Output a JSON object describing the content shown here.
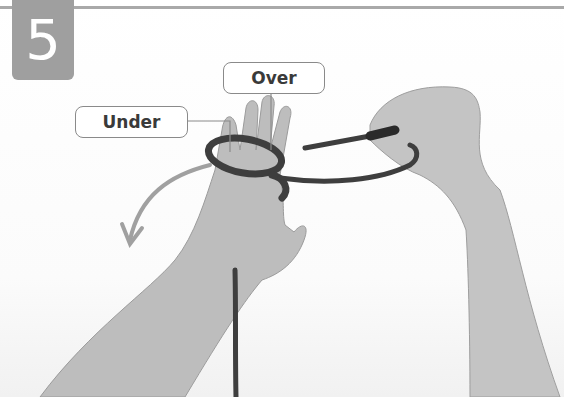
{
  "step": {
    "number": "5"
  },
  "callouts": {
    "over": "Over",
    "under": "Under"
  },
  "illustration": {
    "subject": "hands tying a knot with rope around fingers",
    "arrow_direction": "down-left",
    "colors": {
      "badge": "#9f9f9f",
      "rule": "#a9a9a9",
      "rope": "#3e3e3e",
      "skin": "#b8b8b8",
      "arrow": "#a0a0a0",
      "callout_border": "#8a8a8a"
    }
  }
}
